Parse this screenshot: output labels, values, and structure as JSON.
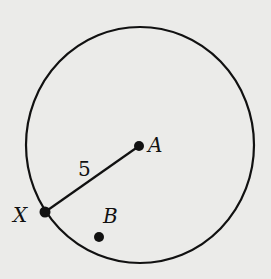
{
  "diagram": {
    "circle": {
      "cx": 140,
      "cy": 145,
      "rx": 114,
      "ry": 118,
      "stroke": "#111111"
    },
    "points": [
      {
        "name": "A",
        "x": 139,
        "y": 146,
        "label": "A",
        "label_x": 148,
        "label_y": 152
      },
      {
        "name": "X",
        "x": 45,
        "y": 212,
        "label": "X",
        "label_x": 14,
        "label_y": 222
      },
      {
        "name": "B",
        "x": 99,
        "y": 237,
        "label": "B",
        "label_x": 103,
        "label_y": 222
      }
    ],
    "segment": {
      "from": "X",
      "to": "A",
      "length_label": "5",
      "label_x": 78,
      "label_y": 176
    },
    "background": "#ebebe9"
  }
}
